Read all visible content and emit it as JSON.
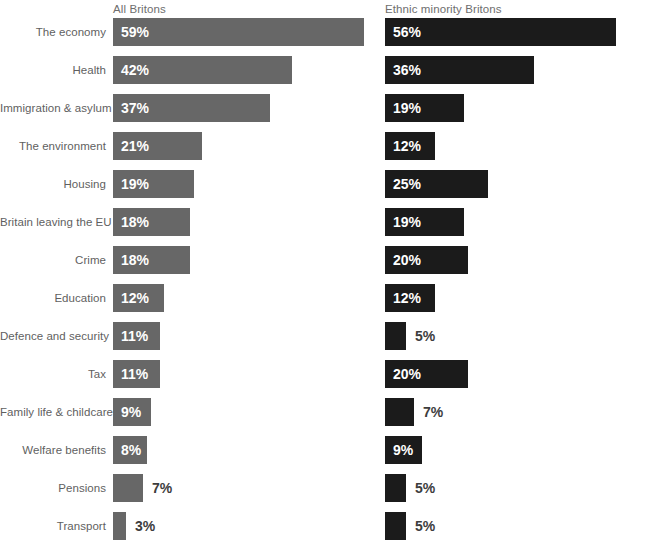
{
  "chart_data": {
    "type": "bar",
    "title": "",
    "subtitle": "",
    "xlabel": "",
    "ylabel": "",
    "grid": false,
    "legend_position": "top",
    "orientation": "horizontal",
    "axis_max_percent": 60,
    "categories": [
      "The economy",
      "Health",
      "Immigration & asylum",
      "The environment",
      "Housing",
      "Britain leaving the EU",
      "Crime",
      "Education",
      "Defence and security",
      "Tax",
      "Family life & childcare",
      "Welfare benefits",
      "Pensions",
      "Transport"
    ],
    "series": [
      {
        "name": "All Britons",
        "color": "#676767",
        "values": [
          59,
          42,
          37,
          21,
          19,
          18,
          18,
          12,
          11,
          11,
          9,
          8,
          7,
          3
        ],
        "labels": [
          "59%",
          "42%",
          "37%",
          "21%",
          "19%",
          "18%",
          "18%",
          "12%",
          "11%",
          "11%",
          "9%",
          "8%",
          "7%",
          "3%"
        ]
      },
      {
        "name": "Ethnic minority Britons",
        "color": "#1b1b1b",
        "values": [
          56,
          36,
          19,
          12,
          25,
          19,
          20,
          12,
          5,
          20,
          7,
          9,
          5,
          5
        ],
        "labels": [
          "56%",
          "36%",
          "19%",
          "12%",
          "25%",
          "19%",
          "20%",
          "12%",
          "5%",
          "20%",
          "7%",
          "9%",
          "5%",
          "5%"
        ]
      }
    ]
  },
  "headers": {
    "left": "All Britons",
    "right": "Ethnic minority Britons"
  },
  "footnote": ""
}
